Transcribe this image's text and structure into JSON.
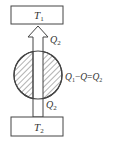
{
  "diagram": {
    "top_reservoir": {
      "symbol": "T",
      "subscript": "1"
    },
    "bottom_reservoir": {
      "symbol": "T",
      "subscript": "2"
    },
    "arrow_top_label": {
      "symbol": "Q",
      "subscript": "2"
    },
    "arrow_bottom_label": {
      "symbol": "Q",
      "subscript": "2"
    },
    "equation": {
      "lhs_symbol": "Q",
      "lhs_subscript": "1",
      "minus": "−",
      "mid_symbol": "Q",
      "equals": "=",
      "rhs_symbol": "Q",
      "rhs_subscript": "2"
    },
    "colors": {
      "stroke": "#444444",
      "hatch": "#666666",
      "background": "#ffffff"
    }
  }
}
